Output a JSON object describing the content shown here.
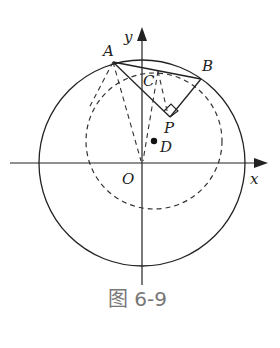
{
  "figure": {
    "caption": "图 6-9",
    "labels": {
      "y_axis": "y",
      "x_axis": "x",
      "origin": "O",
      "A": "A",
      "B": "B",
      "C": "C",
      "P": "P",
      "D": "D"
    },
    "colors": {
      "stroke": "#222222",
      "caption": "#777777"
    },
    "elements": [
      "large solid circle centered at O",
      "dashed circle centered at D",
      "chord AB",
      "segments AP and BP with right angle at P",
      "dashed segments from C to P and from A to O",
      "dashed segment from C (midpoint of AB)"
    ]
  }
}
